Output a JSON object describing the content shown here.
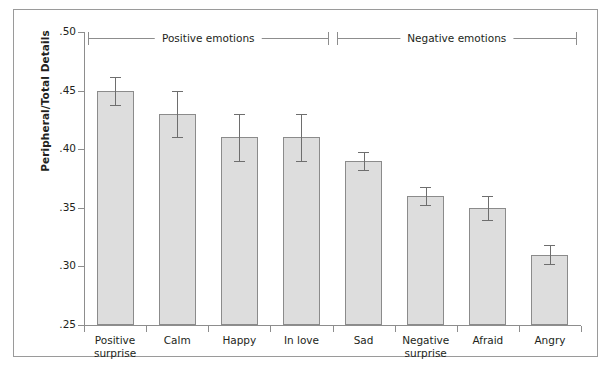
{
  "chart_data": {
    "type": "bar",
    "title": "",
    "xlabel": "",
    "ylabel": "Peripheral/Total Details",
    "ylim": [
      0.25,
      0.5
    ],
    "ytick_values": [
      0.5,
      0.45,
      0.4,
      0.35,
      0.3,
      0.25
    ],
    "ytick_labels": [
      ".50",
      ".45",
      ".40",
      ".35",
      ".30",
      ".25"
    ],
    "grid": false,
    "legend": "none",
    "categories": [
      "Positive surprise",
      "Calm",
      "Happy",
      "In love",
      "Sad",
      "Negative surprise",
      "Afraid",
      "Angry"
    ],
    "values": [
      0.45,
      0.43,
      0.41,
      0.41,
      0.39,
      0.36,
      0.35,
      0.31
    ],
    "errors": [
      0.012,
      0.02,
      0.02,
      0.02,
      0.008,
      0.008,
      0.01,
      0.008
    ],
    "bars": [
      {
        "label_line1": "Positive",
        "label_line2": "surprise",
        "value": 0.45,
        "error": 0.012,
        "group": "Positive emotions"
      },
      {
        "label_line1": "Calm",
        "label_line2": "",
        "value": 0.43,
        "error": 0.02,
        "group": "Positive emotions"
      },
      {
        "label_line1": "Happy",
        "label_line2": "",
        "value": 0.41,
        "error": 0.02,
        "group": "Positive emotions"
      },
      {
        "label_line1": "In love",
        "label_line2": "",
        "value": 0.41,
        "error": 0.02,
        "group": "Positive emotions"
      },
      {
        "label_line1": "Sad",
        "label_line2": "",
        "value": 0.39,
        "error": 0.008,
        "group": "Negative emotions"
      },
      {
        "label_line1": "Negative",
        "label_line2": "surprise",
        "value": 0.36,
        "error": 0.008,
        "group": "Negative emotions"
      },
      {
        "label_line1": "Afraid",
        "label_line2": "",
        "value": 0.35,
        "error": 0.01,
        "group": "Negative emotions"
      },
      {
        "label_line1": "Angry",
        "label_line2": "",
        "value": 0.31,
        "error": 0.008,
        "group": "Negative emotions"
      }
    ],
    "groups": [
      {
        "label": "Positive emotions",
        "start_index": 0,
        "end_index": 3
      },
      {
        "label": "Negative emotions",
        "start_index": 4,
        "end_index": 7
      }
    ],
    "colors": {
      "bar_fill": "#dddddd",
      "bar_stroke": "#8b8b8b",
      "error_bar": "#6e6e6e",
      "axis": "#8d8d8d",
      "text": "#231f20",
      "frame": "#9a9a9a",
      "background": "#ffffff"
    }
  }
}
